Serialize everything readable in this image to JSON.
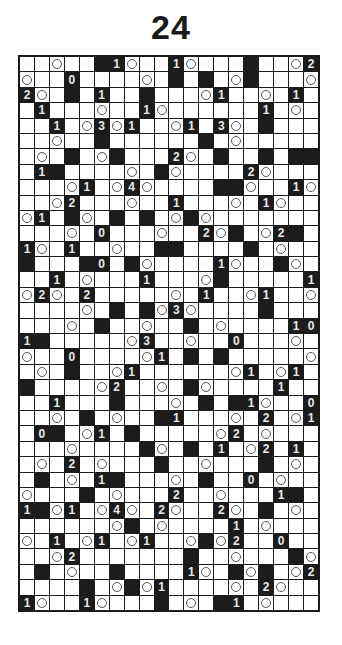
{
  "title": "24",
  "puzzle": {
    "rows": 36,
    "cols": 20,
    "legend": {
      ".": "white",
      "#": "black",
      "O": "circle",
      "0-4": "black-with-number"
    },
    "grid": [
      "..O..#1O..1O...#..O2",
      "O..0....O.#.#.O#...O",
      "2O.#.1..#...O1..O.1.",
      ".1...O..1O......1.O.",
      "..1.O3O1..O1.3O.#...",
      "..O..#......#.O.....",
      ".O.#.O#...2O.#..#.##",
      ".1#....O.#O....2O...",
      "...O1.O4O....##O..1O",
      "..O2...O..1...O.1O..",
      "O1.#O.#.#.O#O.......",
      "...O.0...O..2O#.O2#.",
      "1O.1..O..##....#.O..",
      "#...#0.#O....1O..#O.",
      "..1.O...1...O#.....1",
      "O2O.2.....O.1..O1..O",
      "....O.#.#O3O....#...",
      "...O.#..O..#.O....10",
      "1#.....O3..O..0...O.",
      "O..0....O1.#.#.....O",
      ".O.#..O1......O1.O1.",
      "#....O2..O.#O....1..",
      "..1...#...O.#.#1O..0",
      "..O.#.O..#1...O.2.O1",
      ".0#.O1.#.....O2.O...",
      "...O....#O.#.1.O2.1.",
      ".O.2.O...#..O...#.O.",
      ".#.O.1#...O.#..0.O..",
      "O...#.O...2..O...1#.",
      "1#O1.O4O.2O..2O.#.O.",
      "......O#.O....1.O...",
      "O.1.O1.O1..O#O2..0..",
      "..O2.......#..O...#O",
      ".#.O..#....1O.#O#.O2",
      "....#.O#O1....O.2O..",
      "1O..1O...#.O.#1.O..."
    ]
  }
}
